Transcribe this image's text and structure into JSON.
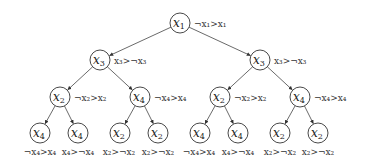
{
  "diagram": {
    "type": "binary-decision-tree",
    "nodes": [
      {
        "id": "n1",
        "var": "x",
        "sub": "1",
        "cx": 180,
        "cy": 23,
        "label": "¬x₁>x₁",
        "lx": 194,
        "ly": 27
      },
      {
        "id": "n2",
        "var": "x",
        "sub": "3",
        "cx": 100,
        "cy": 60,
        "label": "x₃>¬x₃",
        "lx": 114,
        "ly": 64
      },
      {
        "id": "n3",
        "var": "x",
        "sub": "3",
        "cx": 260,
        "cy": 60,
        "label": "x₃>¬x₃",
        "lx": 274,
        "ly": 64
      },
      {
        "id": "n4",
        "var": "x",
        "sub": "2",
        "cx": 60,
        "cy": 97,
        "label": "¬x₂>x₂",
        "lx": 74,
        "ly": 101
      },
      {
        "id": "n5",
        "var": "x",
        "sub": "4",
        "cx": 140,
        "cy": 97,
        "label": "¬x₄>x₄",
        "lx": 154,
        "ly": 101
      },
      {
        "id": "n6",
        "var": "x",
        "sub": "2",
        "cx": 220,
        "cy": 97,
        "label": "¬x₂>x₂",
        "lx": 234,
        "ly": 101
      },
      {
        "id": "n7",
        "var": "x",
        "sub": "4",
        "cx": 300,
        "cy": 97,
        "label": "¬x₄>x₄",
        "lx": 314,
        "ly": 101
      },
      {
        "id": "l1",
        "var": "x",
        "sub": "4",
        "cx": 40,
        "cy": 133,
        "label": "¬x₄>x₄",
        "lx": 40,
        "ly": 155,
        "anchor": "middle"
      },
      {
        "id": "l2",
        "var": "x",
        "sub": "4",
        "cx": 78,
        "cy": 133,
        "label": "x₄>¬x₄",
        "lx": 78,
        "ly": 155,
        "anchor": "middle"
      },
      {
        "id": "l3",
        "var": "x",
        "sub": "2",
        "cx": 120,
        "cy": 133,
        "label": "x₂>¬x₂",
        "lx": 119,
        "ly": 155,
        "anchor": "middle"
      },
      {
        "id": "l4",
        "var": "x",
        "sub": "2",
        "cx": 158,
        "cy": 133,
        "label": "x₂>¬x₂",
        "lx": 158,
        "ly": 155,
        "anchor": "middle"
      },
      {
        "id": "l5",
        "var": "x",
        "sub": "4",
        "cx": 200,
        "cy": 133,
        "label": "¬x₄>x₄",
        "lx": 199,
        "ly": 155,
        "anchor": "middle"
      },
      {
        "id": "l6",
        "var": "x",
        "sub": "4",
        "cx": 238,
        "cy": 133,
        "label": "x₄>¬x₄",
        "lx": 238,
        "ly": 155,
        "anchor": "middle"
      },
      {
        "id": "l7",
        "var": "x",
        "sub": "2",
        "cx": 280,
        "cy": 133,
        "label": "x₂>¬x₂",
        "lx": 280,
        "ly": 155,
        "anchor": "middle"
      },
      {
        "id": "l8",
        "var": "x",
        "sub": "2",
        "cx": 318,
        "cy": 133,
        "label": "x₂>¬x₂",
        "lx": 318,
        "ly": 155,
        "anchor": "middle"
      }
    ],
    "edges": [
      [
        "n1",
        "n2"
      ],
      [
        "n1",
        "n3"
      ],
      [
        "n2",
        "n4"
      ],
      [
        "n2",
        "n5"
      ],
      [
        "n3",
        "n6"
      ],
      [
        "n3",
        "n7"
      ],
      [
        "n4",
        "l1"
      ],
      [
        "n4",
        "l2"
      ],
      [
        "n5",
        "l3"
      ],
      [
        "n5",
        "l4"
      ],
      [
        "n6",
        "l5"
      ],
      [
        "n6",
        "l6"
      ],
      [
        "n7",
        "l7"
      ],
      [
        "n7",
        "l8"
      ]
    ],
    "radius": 10
  }
}
